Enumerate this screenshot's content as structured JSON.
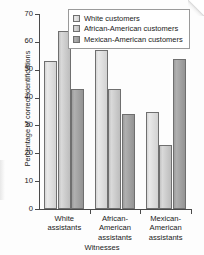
{
  "chart_data": {
    "type": "bar",
    "title": "",
    "xlabel": "Witnesses",
    "ylabel": "Percentage of correct identifications",
    "categories": [
      "White\nassistants",
      "African-\nAmerican\nassistants",
      "Mexican-\nAmerican\nassistants"
    ],
    "category_lines": [
      [
        "White",
        "assistants"
      ],
      [
        "African-",
        "American",
        "assistants"
      ],
      [
        "Mexican-",
        "American",
        "assistants"
      ]
    ],
    "series": [
      {
        "name": "White customers",
        "values": [
          53,
          57,
          35
        ],
        "color": "#e2e2e2"
      },
      {
        "name": "African-American customers",
        "values": [
          64,
          43,
          23
        ],
        "color": "#cfcfcf"
      },
      {
        "name": "Mexican-American customers",
        "values": [
          43,
          34,
          54
        ],
        "color": "#a6a6a6"
      }
    ],
    "ylim": [
      0,
      70
    ],
    "yticks": [
      0,
      10,
      20,
      30,
      40,
      50,
      60,
      70
    ],
    "ytick_labels": [
      "0",
      "10",
      "20",
      "30",
      "40",
      "50",
      "60",
      "70"
    ],
    "grid": false,
    "legend_position": "top-right"
  },
  "legend": {
    "items": [
      {
        "label": "White customers",
        "swatch": "legend-swatch-white-customers"
      },
      {
        "label": "African-American customers",
        "swatch": "legend-swatch-african-american-customers"
      },
      {
        "label": "Mexican-American customers",
        "swatch": "legend-swatch-mexican-american-customers"
      }
    ]
  },
  "axes": {
    "y_title": "Percentage of correct identifications",
    "x_title": "Witnesses"
  }
}
